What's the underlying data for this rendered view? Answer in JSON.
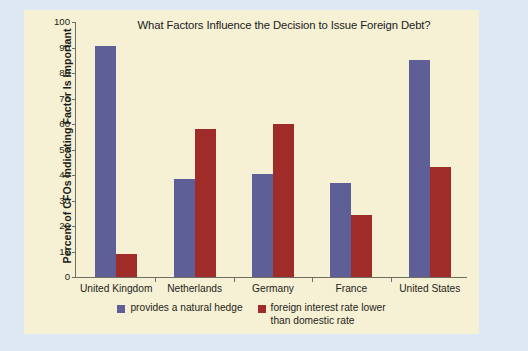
{
  "chart_data": {
    "type": "bar",
    "title": "What Factors Influence the Decision to Issue Foreign Debt?",
    "xlabel": "",
    "ylabel": "Percent of CFOs Indicating Factor Is Important",
    "ylim": [
      0,
      100
    ],
    "yticks": [
      0,
      10,
      20,
      30,
      40,
      50,
      60,
      70,
      80,
      90,
      100
    ],
    "ytick_labels": [
      "0",
      "10",
      "20",
      "30",
      "40",
      "50",
      "60",
      "70",
      "80",
      "90",
      "100"
    ],
    "grid": false,
    "legend_position": "bottom-center",
    "categories": [
      "United Kingdom",
      "Netherlands",
      "Germany",
      "France",
      "United States"
    ],
    "series": [
      {
        "name": "provides a natural hedge",
        "color": "#5d5f96",
        "values": [
          90.5,
          38.5,
          40.5,
          37,
          85
        ]
      },
      {
        "name": "foreign interest rate lower than domestic rate",
        "name_line1": "foreign interest rate lower",
        "name_line2": "than domestic rate",
        "color": "#9f2c28",
        "values": [
          9,
          58,
          60,
          24.5,
          43
        ]
      }
    ]
  },
  "colors": {
    "page_background": "#dee7f4",
    "panel_background": "#f6f1d4",
    "axis": "#6e6e62",
    "series_blue": "#5d5f96",
    "series_red": "#9f2c28",
    "text": "#1e1e1a"
  }
}
